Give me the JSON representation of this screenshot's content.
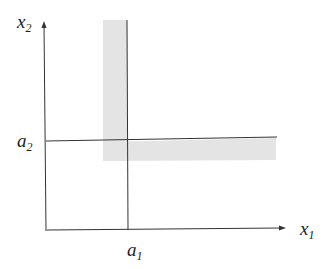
{
  "diagram": {
    "axes": {
      "x_label": {
        "base": "x",
        "sub": "1"
      },
      "y_label": {
        "base": "x",
        "sub": "2"
      }
    },
    "markers": {
      "a1": {
        "base": "a",
        "sub": "1"
      },
      "a2": {
        "base": "a",
        "sub": "2"
      }
    },
    "colors": {
      "line": "#333333",
      "shade": "#e4e4e4",
      "background": "#ffffff"
    }
  }
}
